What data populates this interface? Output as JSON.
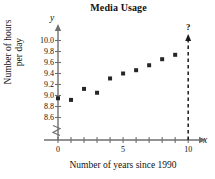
{
  "chart_data": {
    "type": "scatter",
    "title": "Media Usage",
    "xlabel": "Number of years since 1990",
    "ylabel_line1": "Number of hours",
    "ylabel_line2": "per day",
    "x_axis_letter": "x",
    "y_axis_letter": "y",
    "x": [
      0,
      1,
      2,
      3,
      4,
      5,
      6,
      7,
      8,
      9
    ],
    "values": [
      8.95,
      8.92,
      9.12,
      9.05,
      9.31,
      9.4,
      9.46,
      9.55,
      9.66,
      9.74
    ],
    "xlim": [
      0,
      10.6
    ],
    "ylim": [
      8.5,
      10.1
    ],
    "x_ticks": [
      0,
      1,
      2,
      3,
      4,
      5,
      6,
      7,
      8,
      9,
      10
    ],
    "x_tick_labels": [
      "0",
      "",
      "",
      "",
      "",
      "5",
      "",
      "",
      "",
      "",
      "10"
    ],
    "y_ticks": [
      8.6,
      8.8,
      9.0,
      9.2,
      9.4,
      9.6,
      9.8,
      10.0
    ],
    "y_tick_labels": [
      "8.6",
      "8.8",
      "9.0",
      "9.2",
      "9.4",
      "9.6",
      "9.8",
      "10.0"
    ],
    "grid": false,
    "legend": null,
    "y_axis_break": true,
    "annotations": [
      {
        "name": "prediction-marker",
        "text": "?",
        "x": 10,
        "style": "dashed-vertical-line-with-up-arrow",
        "description": "Dashed vertical line at x = 10 topped by an up arrow and a question mark"
      }
    ],
    "marker": {
      "shape": "square",
      "color": "#262626",
      "size": 4
    },
    "colors": {
      "axis": "#6f6f6f",
      "marker": "#262626",
      "text": "#111111"
    }
  }
}
